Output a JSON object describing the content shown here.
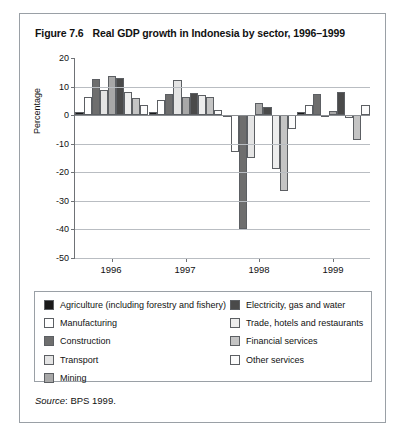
{
  "figure": {
    "number": "Figure 7.6",
    "title": "Real GDP growth in Indonesia by sector, 1996–1999",
    "source_word": "Source",
    "source_rest": ": BPS 1999."
  },
  "legend": {
    "left": [
      {
        "label": "Agriculture (including forestry and fishery)",
        "color": "#1a1a1a"
      },
      {
        "label": "Manufacturing",
        "color": "#ffffff"
      },
      {
        "label": "Construction",
        "color": "#6e6e6e"
      },
      {
        "label": "Transport",
        "color": "#e4e4e4"
      },
      {
        "label": "Mining",
        "color": "#a8a8a8"
      }
    ],
    "right": [
      {
        "label": "Electricity, gas and water",
        "color": "#4a4a4a"
      },
      {
        "label": "Trade, hotels and restaurants",
        "color": "#ededed"
      },
      {
        "label": "Financial services",
        "color": "#c4c4c4"
      },
      {
        "label": "Other services",
        "color": "#fbfbfb"
      }
    ]
  },
  "chart_data": {
    "type": "bar",
    "title": "Real GDP growth in Indonesia by sector, 1996–1999",
    "xlabel": "",
    "ylabel": "Percentage",
    "categories": [
      "1996",
      "1997",
      "1998",
      "1999"
    ],
    "ylim": [
      -50,
      20
    ],
    "yticks": [
      20,
      10,
      0,
      -10,
      -20,
      -30,
      -40,
      -50
    ],
    "grid": true,
    "legend_position": "below-plot",
    "series": [
      {
        "name": "Agriculture (including forestry and fishery)",
        "color": "#1a1a1a",
        "values": [
          1.1,
          1.0,
          0.2,
          1.0
        ]
      },
      {
        "name": "Manufacturing",
        "color": "#ffffff",
        "values": [
          6.5,
          5.3,
          -12.9,
          3.4
        ]
      },
      {
        "name": "Construction",
        "color": "#6e6e6e",
        "values": [
          12.8,
          7.4,
          -39.7,
          7.5
        ]
      },
      {
        "name": "Transport",
        "color": "#e4e4e4",
        "values": [
          8.7,
          12.2,
          -15.1,
          -0.5
        ]
      },
      {
        "name": "Mining",
        "color": "#a8a8a8",
        "values": [
          13.6,
          6.4,
          4.2,
          1.4
        ]
      },
      {
        "name": "Electricity, gas and water",
        "color": "#4a4a4a",
        "values": [
          13.0,
          7.6,
          3.0,
          8.1
        ]
      },
      {
        "name": "Trade, hotels and restaurants",
        "color": "#ededed",
        "values": [
          8.0,
          7.2,
          -18.9,
          -1.1
        ]
      },
      {
        "name": "Financial services",
        "color": "#c4c4c4",
        "values": [
          6.0,
          6.5,
          -26.6,
          -8.7
        ]
      },
      {
        "name": "Other services",
        "color": "#fbfbfb",
        "values": [
          3.4,
          1.7,
          -4.7,
          3.6
        ]
      }
    ]
  }
}
